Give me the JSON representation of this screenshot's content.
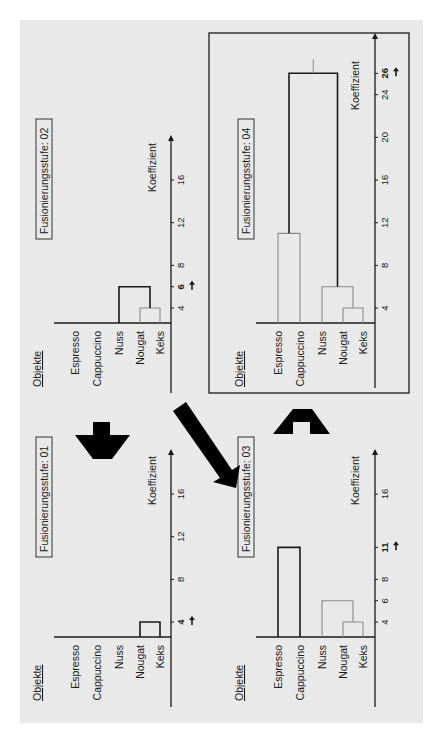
{
  "figure": {
    "background": "#e9e9e9",
    "ink": "#1a1a1a",
    "grey_line": "#8a8a8a",
    "objects_header": "Objekte",
    "axis_label": "Koeffizient",
    "objects": [
      "Espresso",
      "Cappuccino",
      "Nuss",
      "Nougat",
      "Keks"
    ]
  },
  "panels": [
    {
      "id": "01",
      "title": "Fusionierungsstufe: 01",
      "ticks": [
        4,
        8,
        12,
        16
      ],
      "highlight_tick": 4,
      "boxed": false,
      "merges": [
        {
          "a": "Nougat",
          "b": "Keks",
          "level": 4,
          "current": true
        }
      ]
    },
    {
      "id": "02",
      "title": "Fusionierungsstufe: 02",
      "ticks": [
        4,
        6,
        8,
        12,
        16
      ],
      "highlight_tick": 6,
      "boxed": false,
      "merges": [
        {
          "a": "Nougat",
          "b": "Keks",
          "level": 4,
          "current": false
        },
        {
          "a": "Nuss",
          "b": "Nougat+Keks",
          "level": 6,
          "current": true
        }
      ]
    },
    {
      "id": "03",
      "title": "Fusionierungsstufe: 03",
      "ticks": [
        4,
        6,
        8,
        11,
        16
      ],
      "highlight_tick": 11,
      "boxed": false,
      "merges": [
        {
          "a": "Nougat",
          "b": "Keks",
          "level": 4,
          "current": false
        },
        {
          "a": "Nuss",
          "b": "Nougat+Keks",
          "level": 6,
          "current": false
        },
        {
          "a": "Espresso",
          "b": "Cappuccino",
          "level": 11,
          "current": true
        }
      ]
    },
    {
      "id": "04",
      "title": "Fusionierungsstufe: 04",
      "ticks": [
        4,
        8,
        12,
        16,
        20,
        24,
        26
      ],
      "highlight_tick": 26,
      "boxed": true,
      "merges": [
        {
          "a": "Nougat",
          "b": "Keks",
          "level": 4,
          "current": false
        },
        {
          "a": "Nuss",
          "b": "Nougat+Keks",
          "level": 6,
          "current": false
        },
        {
          "a": "Espresso",
          "b": "Cappuccino",
          "level": 11,
          "current": false
        },
        {
          "a": "Espresso+Cappuccino",
          "b": "Nuss+Nougat+Keks",
          "level": 26,
          "current": true
        }
      ]
    }
  ],
  "flow_arrows": [
    {
      "from": "01",
      "to": "02",
      "direction": "up"
    },
    {
      "from": "02",
      "to": "03",
      "direction": "diagonal"
    },
    {
      "from": "03",
      "to": "04",
      "direction": "up"
    }
  ],
  "chart_data": {
    "type": "dendrogram",
    "xlabel": "Objekte",
    "ylabel": "Koeffizient",
    "objects": [
      "Espresso",
      "Cappuccino",
      "Nuss",
      "Nougat",
      "Keks"
    ],
    "steps": [
      {
        "step": 1,
        "merged": [
          "Nougat",
          "Keks"
        ],
        "coefficient": 4
      },
      {
        "step": 2,
        "merged": [
          "Nuss",
          "Nougat+Keks"
        ],
        "coefficient": 6
      },
      {
        "step": 3,
        "merged": [
          "Espresso",
          "Cappuccino"
        ],
        "coefficient": 11
      },
      {
        "step": 4,
        "merged": [
          "Espresso+Cappuccino",
          "Nuss+Nougat+Keks"
        ],
        "coefficient": 26
      }
    ],
    "axis_ticks_small": [
      4,
      8,
      12,
      16
    ],
    "axis_ticks_large": [
      4,
      8,
      12,
      16,
      20,
      24,
      26
    ]
  }
}
